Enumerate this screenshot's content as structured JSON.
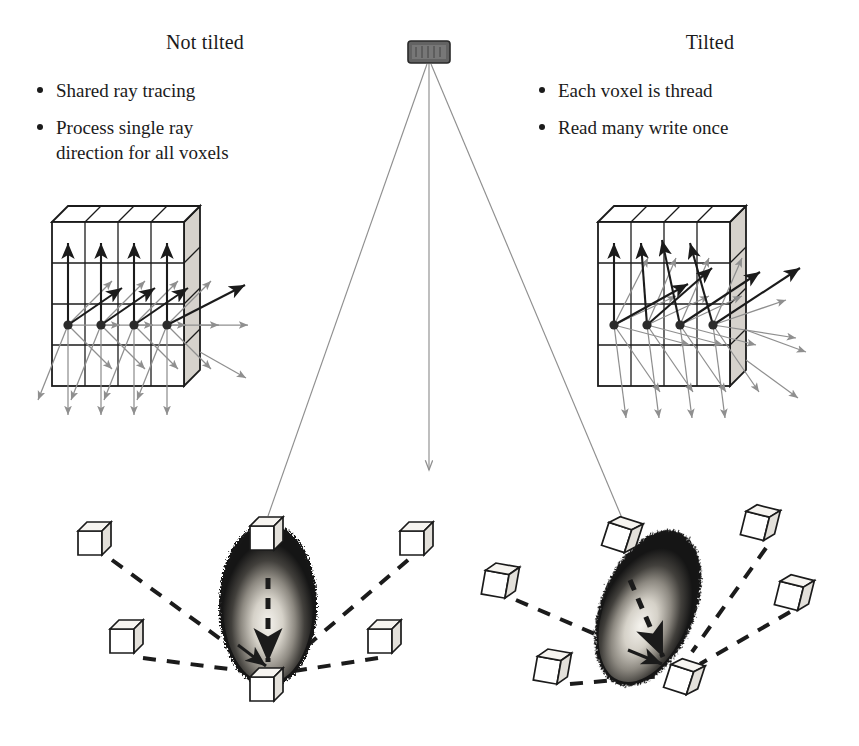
{
  "figure": {
    "width": 859,
    "height": 746,
    "background": "#ffffff",
    "colors": {
      "ink": "#1b1b1b",
      "gray_ray": "#8f8f8f",
      "source_fill": "#636363",
      "grid_side_face": "#d6d2cc",
      "phantom_dark": "#171717",
      "phantom_hot": "#f2f0ea",
      "cube_fill": "#ffffff",
      "cube_shade": "#e3e0da"
    }
  },
  "source": {
    "name": "source-detector",
    "x": 408,
    "y": 41,
    "width": 42,
    "height": 22
  },
  "left_panel": {
    "title": "Not tilted",
    "bullets": [
      "Shared ray tracing",
      "Process single ray\ndirection for all voxels"
    ],
    "bullet_lines": [
      [
        "Shared ray tracing"
      ],
      [
        "Process single ray",
        "direction for all voxels"
      ]
    ]
  },
  "right_panel": {
    "title": "Tilted",
    "bullets": [
      "Each voxel is thread",
      "Read many write once"
    ],
    "bullet_lines": [
      [
        "Each voxel is thread"
      ],
      [
        "Read many write once"
      ]
    ]
  },
  "voxel_grid_left": {
    "name": "voxel-grid-not-tilted",
    "origin_x": 52,
    "origin_y": 222,
    "cell": 33,
    "cols": 4,
    "rows": 4,
    "depth_dx": 16,
    "depth_dy": -16,
    "voxel_dots": 4,
    "dot_row": 3,
    "ray_style": "parallel",
    "description": "Four voxel centers emit identical parallel ray bundles; shared ray directions."
  },
  "voxel_grid_right": {
    "name": "voxel-grid-tilted",
    "origin_x": 598,
    "origin_y": 222,
    "cell": 33,
    "cols": 4,
    "rows": 4,
    "depth_dx": 16,
    "depth_dy": -16,
    "voxel_dots": 4,
    "dot_row": 3,
    "ray_style": "convergent",
    "description": "Each voxel traces its own fan of rays converging on shared detector points."
  },
  "phantom_left": {
    "name": "phantom-not-tilted",
    "cx": 268,
    "cy": 605,
    "rx": 47,
    "ry": 80,
    "rotation_deg": 0,
    "cubes": [
      {
        "label": "top-cube",
        "x": 252,
        "y": 519
      },
      {
        "label": "bottom-cube",
        "x": 252,
        "y": 672
      },
      {
        "label": "satellite-upper-left",
        "x": 85,
        "y": 528
      },
      {
        "label": "satellite-upper-right",
        "x": 405,
        "y": 528
      },
      {
        "label": "satellite-lower-left",
        "x": 116,
        "y": 630
      },
      {
        "label": "satellite-lower-right",
        "x": 375,
        "y": 630
      }
    ]
  },
  "phantom_right": {
    "name": "phantom-tilted",
    "cx": 648,
    "cy": 608,
    "rx": 45,
    "ry": 80,
    "rotation_deg": 22,
    "cubes": [
      {
        "label": "top-cube",
        "x": 611,
        "y": 526
      },
      {
        "label": "bottom-cube",
        "x": 672,
        "y": 665
      },
      {
        "label": "satellite-upper-left",
        "x": 488,
        "y": 570
      },
      {
        "label": "satellite-upper-right",
        "x": 748,
        "y": 512
      },
      {
        "label": "satellite-lower-left",
        "x": 540,
        "y": 655
      },
      {
        "label": "satellite-lower-right",
        "x": 782,
        "y": 580
      }
    ]
  },
  "beam_lines": {
    "name": "source-beam-lines",
    "center_arrow_end_y": 478,
    "targets": [
      "phantom-not-tilted-top-cube",
      "phantom-tilted-top-cube"
    ]
  }
}
